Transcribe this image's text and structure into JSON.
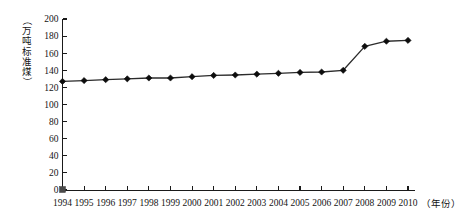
{
  "chart_data": {
    "type": "line",
    "title": "",
    "xlabel": "（年份）",
    "ylabel": "（万吨标准煤）",
    "xlim": [
      1994,
      2010
    ],
    "ylim": [
      0,
      200
    ],
    "grid": false,
    "legend": "none",
    "categories": [
      1994,
      1995,
      1996,
      1997,
      1998,
      1999,
      2000,
      2001,
      2002,
      2003,
      2004,
      2005,
      2006,
      2007,
      2008,
      2009,
      2010
    ],
    "x_tick_labels": [
      "1994",
      "1995",
      "1996",
      "1997",
      "1998",
      "1999",
      "2000",
      "2001",
      "2002",
      "2003",
      "2004",
      "2005",
      "2006",
      "2007",
      "2008",
      "2009",
      "2010"
    ],
    "y_tick_labels": [
      "0",
      "20",
      "40",
      "60",
      "80",
      "100",
      "120",
      "140",
      "160",
      "180",
      "200"
    ],
    "y_ticks": [
      0,
      20,
      40,
      60,
      80,
      100,
      120,
      140,
      160,
      180,
      200
    ],
    "series": [
      {
        "name": "能源消费总量",
        "values": [
          127,
          128,
          129,
          130,
          131,
          131,
          132.5,
          134,
          134.5,
          135.5,
          136.5,
          137.5,
          138,
          140,
          168,
          174,
          175
        ]
      }
    ],
    "marker": "diamond",
    "line_color": "#2b2b2b",
    "marker_color": "#0d0d0d",
    "origin_marker": {
      "x": 1994,
      "y": 0,
      "shape": "square",
      "color": "#4a4a4a"
    }
  }
}
